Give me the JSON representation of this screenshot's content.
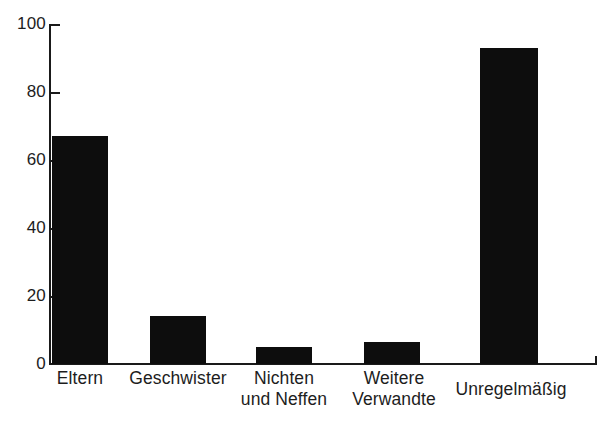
{
  "chart_data": {
    "type": "bar",
    "title": "",
    "subtitle": "",
    "xlabel": "",
    "ylabel": "",
    "categories": [
      "Eltern",
      "Geschwister",
      "Nichten und Neffen",
      "Weitere Verwandte",
      "Unregelmäßig"
    ],
    "category_lines": [
      [
        "Eltern"
      ],
      [
        "Geschwister"
      ],
      [
        "Nichten",
        "und Neffen"
      ],
      [
        "Weitere",
        "Verwandte"
      ],
      [
        "Unregelmäßig"
      ]
    ],
    "values": [
      67,
      14,
      5,
      6.5,
      93
    ],
    "ylim": [
      0,
      100
    ],
    "yticks": [
      0,
      20,
      40,
      60,
      80,
      100
    ],
    "ytick_labels": [
      "0",
      "20",
      "40",
      "60",
      "80",
      "100"
    ],
    "grid": false,
    "legend": null,
    "bar_color": "#0d0d0d",
    "axis_color": "#1a1a1a",
    "background_color": "#ffffff"
  },
  "axis": {
    "y_label_0": "0",
    "y_label_20": "20",
    "y_label_40": "40",
    "y_label_60": "60",
    "y_label_80": "80",
    "y_label_100": "100"
  },
  "categories": {
    "c0_l1": "Eltern",
    "c1_l1": "Geschwister",
    "c2_l1": "Nichten",
    "c2_l2": "und Neffen",
    "c3_l1": "Weitere",
    "c3_l2": "Verwandte",
    "c4_l1": "Unregelmäßig"
  }
}
